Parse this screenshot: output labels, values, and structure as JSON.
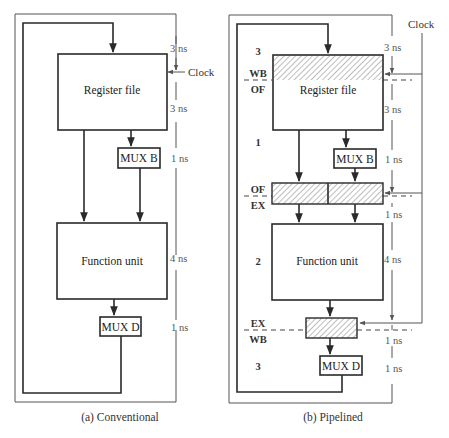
{
  "conventional": {
    "caption": "(a) Conventional",
    "register_file": "Register file",
    "mux_b": "MUX B",
    "function_unit": "Function unit",
    "mux_d": "MUX D",
    "clock": "Clock",
    "delays": [
      "3 ns",
      "3 ns",
      "1 ns",
      "4 ns",
      "1 ns"
    ]
  },
  "pipelined": {
    "caption": "(b) Pipelined",
    "register_file": "Register file",
    "mux_b": "MUX B",
    "function_unit": "Function unit",
    "mux_d": "MUX D",
    "clock": "Clock",
    "delays": [
      "3 ns",
      "3 ns",
      "1 ns",
      "1 ns",
      "4 ns",
      "1 ns",
      "1 ns"
    ],
    "stage_boundaries": [
      {
        "top": "WB",
        "bottom": "OF"
      },
      {
        "top": "OF",
        "bottom": "EX"
      },
      {
        "top": "EX",
        "bottom": "WB"
      }
    ],
    "stage_numbers": [
      "3",
      "1",
      "2",
      "3"
    ]
  },
  "colors": {
    "line": "#2a2a2a",
    "text": "#333333",
    "hatch": "#9a9a9a"
  }
}
